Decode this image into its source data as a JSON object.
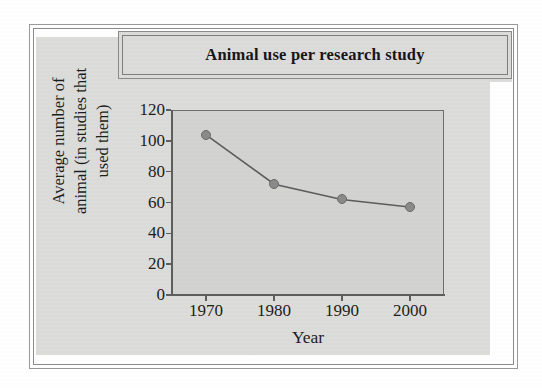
{
  "figure": {
    "title": "Animal use per research study"
  },
  "chart_data": {
    "type": "line",
    "title": "Animal use per research study",
    "xlabel": "Year",
    "ylabel_line1": "Average number of",
    "ylabel_line2": "animal (in studies that",
    "ylabel_line3": "used them)",
    "ylabel": "Average number of animal (in studies that used them)",
    "categories": [
      "1970",
      "1980",
      "1990",
      "2000"
    ],
    "x": [
      1970,
      1980,
      1990,
      2000
    ],
    "values": [
      104,
      72,
      62,
      57
    ],
    "xlim": [
      1965,
      2005
    ],
    "ylim": [
      0,
      120
    ],
    "y_ticks": [
      "0",
      "20",
      "40",
      "60",
      "80",
      "100",
      "120"
    ],
    "y_tick_values": [
      0,
      20,
      40,
      60,
      80,
      100,
      120
    ],
    "x_ticks": [
      "1970",
      "1980",
      "1990",
      "2000"
    ],
    "grid": false,
    "legend": false,
    "marker": "circle",
    "marker_color": "#8b8b8b",
    "line_color": "#5c5c5c",
    "plot_background": "#d3d3d1",
    "page_background": "#dcdcda"
  }
}
